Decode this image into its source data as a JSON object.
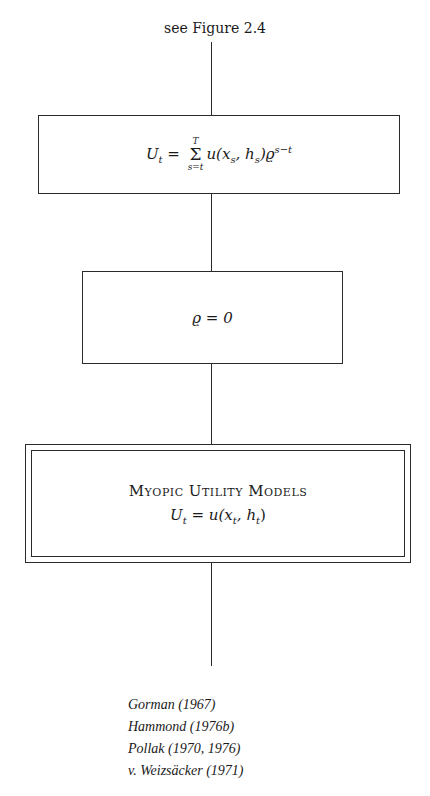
{
  "diagram": {
    "top_caption": "see Figure 2.4",
    "box1": {
      "formula_text": "U_t = Σ_{s=t}^{T} u(x_s, h_s) ϱ^{s−t}",
      "lhs": "U",
      "lhs_sub": "t",
      "eq": " = ",
      "sum_symbol": "Σ",
      "sum_upper": "T",
      "sum_lower": "s=t",
      "term": "u(x",
      "x_sub": "s",
      "mid": ", h",
      "h_sub": "s",
      "close": ")ϱ",
      "exp": "s−t"
    },
    "box2": {
      "formula_text": "ϱ = 0",
      "content": "ϱ = 0"
    },
    "box3": {
      "title": "Myopic Utility Models",
      "formula_text": "U_t = u(x_t, h_t)",
      "lhs": "U",
      "lhs_sub": "t",
      "rhs_a": " = u(x",
      "x_sub": "t",
      "rhs_b": ", h",
      "h_sub": "t",
      "rhs_c": ")"
    },
    "references": [
      "Gorman (1967)",
      "Hammond (1976b)",
      "Pollak (1970, 1976)",
      "v. Weizsäcker (1971)"
    ]
  }
}
